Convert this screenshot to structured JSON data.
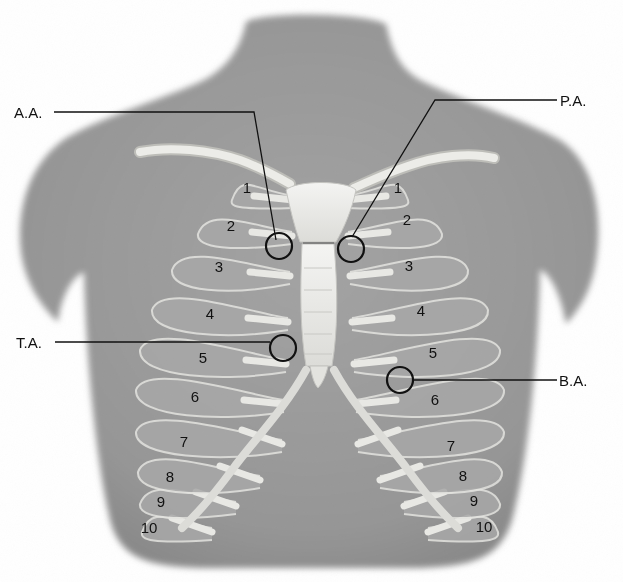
{
  "figure": {
    "colors": {
      "skin": "#9a9a9a",
      "skin_shadow": "#7e7e7e",
      "bone": "#e9e9e6",
      "bone_edge": "#bdbdb8",
      "rib_shade": "#8a8a8a",
      "ink": "#111111",
      "background": "#ffffff"
    }
  },
  "auscultation_points": [
    {
      "id": "aortic",
      "label": "A.A."
    },
    {
      "id": "pulmonic",
      "label": "P.A."
    },
    {
      "id": "tricuspid",
      "label": "T.A."
    },
    {
      "id": "bicuspid",
      "label": "B.A."
    }
  ],
  "rib_labels": {
    "left": [
      "1",
      "2",
      "3",
      "4",
      "5",
      "6",
      "7",
      "8",
      "9",
      "10"
    ],
    "right": [
      "1",
      "2",
      "3",
      "4",
      "5",
      "6",
      "7",
      "8",
      "9",
      "10"
    ]
  }
}
